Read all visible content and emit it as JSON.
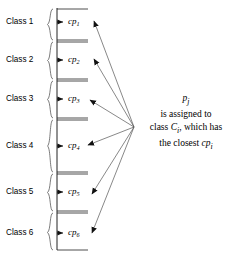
{
  "figure": {
    "stroke_color": "#222222",
    "text_color": "#000000",
    "background": "#ffffff"
  },
  "axis": {
    "top_y": 8,
    "bottom_y": 250,
    "x": 57,
    "tick_end_x": 88
  },
  "classes": [
    {
      "label": "Class 1",
      "cp_base": "cp",
      "cp_sub": "1",
      "marker_y": 22,
      "brace_top": 9,
      "brace_bottom": 40
    },
    {
      "label": "Class 2",
      "cp_base": "cp",
      "cp_sub": "2",
      "marker_y": 60,
      "brace_top": 42,
      "brace_bottom": 79
    },
    {
      "label": "Class 3",
      "cp_base": "cp",
      "cp_sub": "3",
      "marker_y": 99,
      "brace_top": 81,
      "brace_bottom": 118
    },
    {
      "label": "Class 4",
      "cp_base": "cp",
      "cp_sub": "4",
      "marker_y": 146,
      "brace_top": 120,
      "brace_bottom": 172
    },
    {
      "label": "Class 5",
      "cp_base": "cp",
      "cp_sub": "5",
      "marker_y": 192,
      "brace_top": 174,
      "brace_bottom": 211
    },
    {
      "label": "Class 6",
      "cp_base": "cp",
      "cp_sub": "6",
      "marker_y": 233,
      "brace_top": 213,
      "brace_bottom": 250
    }
  ],
  "arrows": {
    "origin_x": 134,
    "origin_y": 127,
    "targets": [
      {
        "x": 92,
        "y": 20
      },
      {
        "x": 92,
        "y": 58
      },
      {
        "x": 88,
        "y": 100
      },
      {
        "x": 86,
        "y": 145
      },
      {
        "x": 90,
        "y": 193
      },
      {
        "x": 90,
        "y": 232
      }
    ]
  },
  "caption": {
    "line1_var": "p",
    "line1_sub": "j",
    "line2": "is assigned to",
    "line3_prefix": "class ",
    "line3_var": "C",
    "line3_sub": "i",
    "line3_suffix": ", which has",
    "line4_prefix": "the closest ",
    "line4_var": "cp",
    "line4_sub": "i"
  }
}
